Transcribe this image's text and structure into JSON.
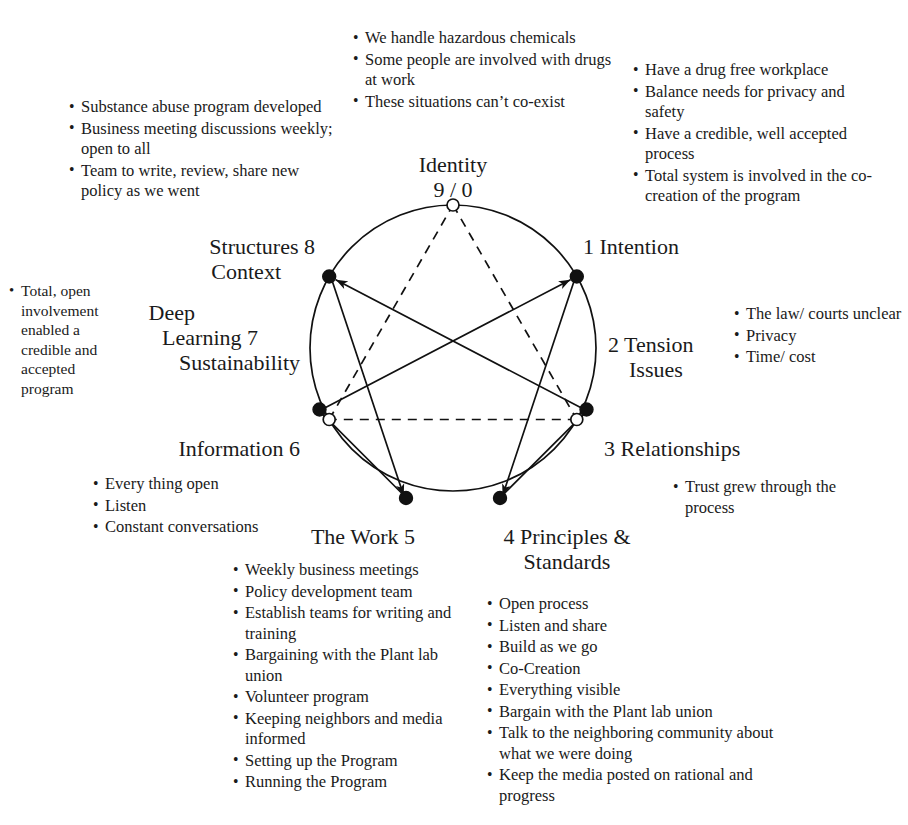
{
  "diagram": {
    "center_label": {
      "name": "Identity",
      "number": "9 / 0"
    },
    "points": [
      {
        "index": "1",
        "label": "1 Intention"
      },
      {
        "index": "2",
        "label": "2 Tension\nIssues",
        "line1": "2 Tension",
        "line2": "Issues"
      },
      {
        "index": "3",
        "label": "3 Relationships"
      },
      {
        "index": "4",
        "label": "4 Principles &\nStandards",
        "line1": "4 Principles &",
        "line2": "Standards"
      },
      {
        "index": "5",
        "label": "The Work 5"
      },
      {
        "index": "6",
        "label": "Information 6"
      },
      {
        "index": "7",
        "label": "Deep\nLearning 7\nSustainability",
        "line1": "Deep",
        "line2": "Learning 7",
        "line3": "Sustainability"
      },
      {
        "index": "8",
        "label": "Structures 8\nContext",
        "line1": "Structures 8",
        "line2": "Context"
      },
      {
        "index": "9",
        "label": "Identity\n9 / 0",
        "line1": "Identity",
        "line2": "9 / 0"
      }
    ],
    "colors": {
      "ink": "#111111",
      "background": "#ffffff"
    }
  },
  "annotations": {
    "identity_top": {
      "name": "identity-notes",
      "items": [
        "We handle hazardous chemicals",
        "Some people are involved with drugs at work",
        "These situations can’t co-exist"
      ]
    },
    "intention_top_right": {
      "name": "intention-notes",
      "items": [
        "Have a drug free workplace",
        "Balance needs for privacy and safety",
        "Have a credible, well accepted process",
        "Total system is involved in the co-creation of the program"
      ]
    },
    "structures_top_left": {
      "name": "structures-notes",
      "items": [
        "Substance abuse program developed",
        "Business meeting discussions weekly; open to all",
        "Team to write, review,  share new policy as we went"
      ]
    },
    "deep_learning_left": {
      "name": "deep-learning-notes",
      "items": [
        "Total, open involvement enabled a credible and accepted program"
      ]
    },
    "tension_right": {
      "name": "tension-notes",
      "items": [
        "The law/ courts unclear",
        "Privacy",
        "Time/ cost"
      ]
    },
    "relationships_right": {
      "name": "relationships-notes",
      "items": [
        "Trust grew through the process"
      ]
    },
    "information_left": {
      "name": "information-notes",
      "items": [
        "Every thing open",
        "Listen",
        "Constant conversations"
      ]
    },
    "the_work_bottom": {
      "name": "the-work-notes",
      "items": [
        "Weekly business meetings",
        "Policy development team",
        "Establish teams for writing and training",
        "Bargaining  with the Plant lab union",
        "Volunteer program",
        "Keeping neighbors and media informed",
        "Setting up the Program",
        "Running the Program"
      ]
    },
    "principles_bottom": {
      "name": "principles-notes",
      "items": [
        "Open process",
        "Listen and share",
        "Build as we go",
        "Co-Creation",
        "Everything visible",
        "Bargain with the Plant lab union",
        "Talk to the neighboring community about what we were doing",
        "Keep the media posted on rational and progress"
      ]
    }
  }
}
